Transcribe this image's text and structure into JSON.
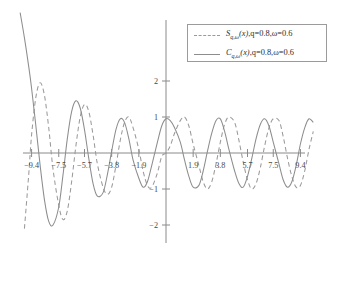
{
  "chart_data": {
    "type": "line",
    "title": "",
    "xlabel": "",
    "ylabel": "",
    "xlim": [
      -10.5,
      10.5
    ],
    "ylim": [
      -2.6,
      2.9
    ],
    "grid": false,
    "legend_position": "top-right",
    "xticks": [
      -9.4,
      -7.5,
      -5.7,
      -3.8,
      -1.9,
      1.9,
      3.8,
      5.7,
      7.5,
      9.4
    ],
    "xtick_labels": [
      "-9.4",
      "-7.5",
      "-5.7",
      "-3.8",
      "-1.9",
      "1.9",
      "3.8",
      "5.7",
      "7.5",
      "9.4"
    ],
    "yticks": [
      2,
      1,
      -1,
      -2
    ],
    "ytick_labels": [
      "2",
      "1",
      "-1",
      "-2"
    ],
    "parameters": {
      "q": "0.8",
      "omega": "0.6"
    },
    "series": [
      {
        "name": "S_{q,w}(x)",
        "style": "dashed",
        "color": "#9a9a9a",
        "legend_label_parts": {
          "symbol": "S",
          "subscript": "q,ω",
          "argument": "(x)",
          "params": ",q=0.8,ω=0.6"
        },
        "x": [
          -10.2,
          -9.9,
          -9.6,
          -9.4,
          -9.1,
          -8.8,
          -8.5,
          -8.2,
          -7.9,
          -7.5,
          -7.2,
          -6.9,
          -6.6,
          -6.3,
          -6.0,
          -5.7,
          -5.4,
          -5.1,
          -4.8,
          -4.4,
          -4.1,
          -3.8,
          -3.5,
          -3.2,
          -2.9,
          -2.6,
          -2.3,
          -1.9,
          -1.6,
          -1.3,
          -1.0,
          -0.6,
          -0.3,
          0.0,
          0.3,
          0.6,
          1.0,
          1.3,
          1.6,
          1.9,
          2.3,
          2.6,
          2.9,
          3.2,
          3.5,
          3.8,
          4.1,
          4.4,
          4.8,
          5.1,
          5.4,
          5.7,
          6.0,
          6.3,
          6.6,
          6.9,
          7.2,
          7.5,
          7.9,
          8.2,
          8.5,
          8.8,
          9.1,
          9.4,
          9.7,
          10.0,
          10.3
        ],
        "y": [
          -3.6,
          -2.1,
          -0.6,
          0.5,
          1.55,
          1.95,
          1.6,
          0.7,
          -0.45,
          -1.45,
          -1.85,
          -1.6,
          -0.8,
          0.2,
          1.0,
          1.35,
          1.15,
          0.5,
          -0.3,
          -0.95,
          -1.15,
          -0.95,
          -0.35,
          0.35,
          0.85,
          1.0,
          0.7,
          0.1,
          -0.5,
          -0.9,
          -0.95,
          -0.55,
          -0.1,
          0.0,
          0.2,
          0.55,
          0.9,
          1.0,
          0.75,
          0.25,
          -0.35,
          -0.8,
          -1.0,
          -0.8,
          -0.3,
          0.3,
          0.8,
          1.0,
          0.85,
          0.35,
          -0.25,
          -0.75,
          -1.0,
          -0.85,
          -0.4,
          0.2,
          0.7,
          0.95,
          0.9,
          0.45,
          -0.15,
          -0.65,
          -0.95,
          -0.9,
          -0.5,
          0.1,
          0.6
        ]
      },
      {
        "name": "C_{q,w}(x)",
        "style": "solid",
        "color": "#8d8d8d",
        "legend_label_parts": {
          "symbol": "C",
          "subscript": "q,ω",
          "argument": "(x)",
          "params": ",q=0.8,ω=0.6"
        },
        "x": [
          -10.2,
          -9.9,
          -9.6,
          -9.4,
          -9.1,
          -8.8,
          -8.5,
          -8.2,
          -7.9,
          -7.5,
          -7.2,
          -6.9,
          -6.6,
          -6.3,
          -6.0,
          -5.7,
          -5.4,
          -5.1,
          -4.8,
          -4.4,
          -4.1,
          -3.8,
          -3.5,
          -3.2,
          -2.9,
          -2.6,
          -2.3,
          -1.9,
          -1.6,
          -1.3,
          -1.0,
          -0.6,
          -0.3,
          0.0,
          0.3,
          0.6,
          1.0,
          1.3,
          1.6,
          1.9,
          2.3,
          2.6,
          2.9,
          3.2,
          3.5,
          3.8,
          4.1,
          4.4,
          4.8,
          5.1,
          5.4,
          5.7,
          6.0,
          6.3,
          6.6,
          6.9,
          7.2,
          7.5,
          7.9,
          8.2,
          8.5,
          8.8,
          9.1,
          9.4,
          9.7,
          10.0,
          10.3
        ],
        "y": [
          3.9,
          3.2,
          2.4,
          1.8,
          0.75,
          -0.35,
          -1.3,
          -1.9,
          -2.0,
          -1.5,
          -0.6,
          0.4,
          1.15,
          1.45,
          1.25,
          0.65,
          -0.15,
          -0.85,
          -1.2,
          -1.1,
          -0.6,
          0.05,
          0.65,
          0.95,
          0.85,
          0.4,
          -0.2,
          -0.7,
          -0.95,
          -0.8,
          -0.35,
          0.3,
          0.75,
          0.95,
          0.9,
          0.7,
          0.3,
          -0.2,
          -0.65,
          -0.95,
          -0.9,
          -0.5,
          0.05,
          0.55,
          0.9,
          0.95,
          0.6,
          0.1,
          -0.5,
          -0.85,
          -0.95,
          -0.65,
          -0.15,
          0.4,
          0.8,
          0.95,
          0.75,
          0.3,
          -0.3,
          -0.75,
          -0.95,
          -0.8,
          -0.35,
          0.25,
          0.7,
          0.95,
          0.85
        ]
      }
    ]
  }
}
